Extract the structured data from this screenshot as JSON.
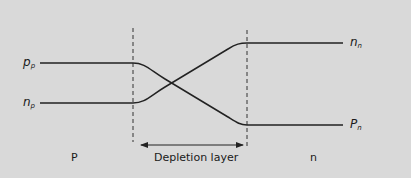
{
  "diagram": {
    "colors": {
      "background": "#d9d9d9",
      "line": "#222222"
    },
    "curves": {
      "majority_p": {
        "label_main": "p",
        "label_sub": "p",
        "right_label_main": "P",
        "right_label_sub": "n"
      },
      "minority_p": {
        "label_main": "n",
        "label_sub": "p",
        "right_label_main": "n",
        "right_label_sub": "n"
      }
    },
    "regions": {
      "p_region": "P",
      "depletion": "Depletion layer",
      "n_region": "n"
    }
  }
}
